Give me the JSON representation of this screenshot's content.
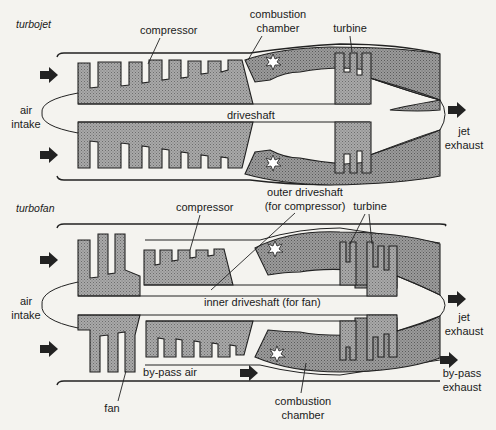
{
  "diagrams": [
    {
      "id": "turbojet",
      "title": "turbojet",
      "labels": {
        "compressor": "compressor",
        "combustion_chamber_1": "combustion",
        "combustion_chamber_2": "chamber",
        "turbine": "turbine",
        "driveshaft": "driveshaft",
        "air_intake_1": "air",
        "air_intake_2": "intake",
        "jet_exhaust_1": "jet",
        "jet_exhaust_2": "exhaust"
      }
    },
    {
      "id": "turbofan",
      "title": "turbofan",
      "labels": {
        "compressor": "compressor",
        "outer_driveshaft_1": "outer driveshaft",
        "outer_driveshaft_2": "(for compressor)",
        "turbine": "turbine",
        "inner_driveshaft": "inner driveshaft (for fan)",
        "air_intake_1": "air",
        "air_intake_2": "intake",
        "jet_exhaust_1": "jet",
        "jet_exhaust_2": "exhaust",
        "fan": "fan",
        "bypass_air": "by-pass air",
        "bypass_exhaust_1": "by-pass",
        "bypass_exhaust_2": "exhaust",
        "combustion_chamber_1": "combustion",
        "combustion_chamber_2": "chamber"
      }
    }
  ],
  "colors": {
    "background": "#f4f3ef",
    "component_fill": "#9a9a9a",
    "chamber_fill": "#8c8c8c",
    "line": "#222222"
  }
}
